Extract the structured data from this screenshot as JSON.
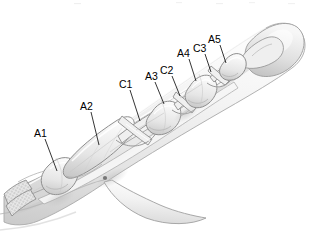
{
  "figure": {
    "background_color": "#ffffff",
    "ink_color": "#000000",
    "tissue_fill": "#ececec",
    "tendon_fill": "#f2f2f2",
    "pulley_fill": "#e4e4e4",
    "outline_color": "#8a8a8a"
  },
  "labels": [
    {
      "id": "A1",
      "text": "A1",
      "x": 34,
      "y": 128,
      "leader": {
        "x1": 45,
        "y1": 139,
        "x2": 57,
        "y2": 171
      }
    },
    {
      "id": "A2",
      "text": "A2",
      "x": 80,
      "y": 101,
      "leader": {
        "x1": 91,
        "y1": 112,
        "x2": 99,
        "y2": 145
      }
    },
    {
      "id": "C1",
      "text": "C1",
      "x": 119,
      "y": 79,
      "leader": {
        "x1": 130,
        "y1": 90,
        "x2": 140,
        "y2": 121
      }
    },
    {
      "id": "A3",
      "text": "A3",
      "x": 145,
      "y": 71,
      "leader": {
        "x1": 155,
        "y1": 82,
        "x2": 164,
        "y2": 104
      }
    },
    {
      "id": "C2",
      "text": "C2",
      "x": 160,
      "y": 65,
      "leader": {
        "x1": 172,
        "y1": 76,
        "x2": 180,
        "y2": 96
      }
    },
    {
      "id": "A4",
      "text": "A4",
      "x": 177,
      "y": 48,
      "leader": {
        "x1": 189,
        "y1": 59,
        "x2": 196,
        "y2": 81
      }
    },
    {
      "id": "C3",
      "text": "C3",
      "x": 193,
      "y": 43,
      "leader": {
        "x1": 205,
        "y1": 54,
        "x2": 211,
        "y2": 72
      }
    },
    {
      "id": "A5",
      "text": "A5",
      "x": 208,
      "y": 34,
      "leader": {
        "x1": 220,
        "y1": 45,
        "x2": 226,
        "y2": 63
      }
    }
  ],
  "annotations": {
    "annular_pulleys": [
      "A1",
      "A2",
      "A3",
      "A4",
      "A5"
    ],
    "cruciate_pulleys": [
      "C1",
      "C2",
      "C3"
    ],
    "structures": [
      "cut-flexor-tendon-end",
      "flexor-tendon",
      "proximal-phalanx",
      "middle-phalanx",
      "distal-phalanx",
      "finger-skin-outline",
      "palm-web-fold"
    ]
  }
}
